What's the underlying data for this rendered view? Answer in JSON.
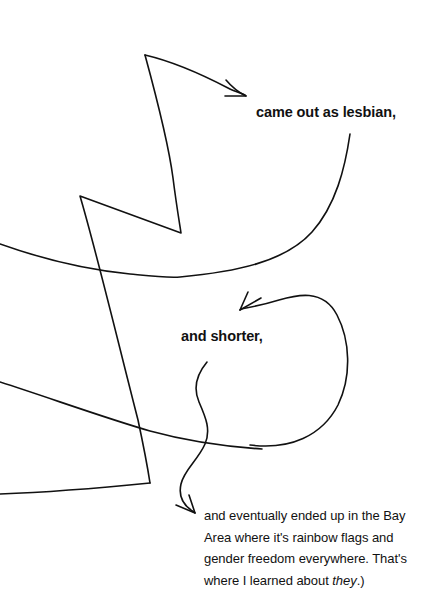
{
  "page": {
    "width": 440,
    "height": 600,
    "background_color": "#ffffff",
    "ink_color": "#111111"
  },
  "annotations": {
    "label_lesbian": "came out as lesbian,",
    "label_shorter": "and shorter,",
    "paragraph_bay_area": {
      "line1": "and eventually ended up in the Bay",
      "line2": "Area where it's rainbow flags and",
      "line3": "gender freedom everywhere. That's",
      "line4_prefix": "where I learned about ",
      "line4_italic": "they",
      "line4_suffix": ".)"
    }
  },
  "sketch": {
    "description": "hand-drawn pen strokes with three arrows",
    "strokes": [
      {
        "name": "arrow-to-lesbian",
        "kind": "arrow",
        "from": [
          145,
          55
        ],
        "to": [
          246,
          96
        ],
        "arrowhead": "right-down"
      },
      {
        "name": "long-descending-zigzag",
        "kind": "open-path",
        "points": [
          [
            145,
            55
          ],
          [
            172,
            170
          ],
          [
            181,
            233
          ],
          [
            80,
            196
          ],
          [
            150,
            483
          ]
        ]
      },
      {
        "name": "long-horizontal-curve",
        "kind": "open-path",
        "points": [
          [
            0,
            244
          ],
          [
            120,
            270
          ],
          [
            178,
            277
          ],
          [
            300,
            250
          ],
          [
            350,
            134
          ]
        ]
      },
      {
        "name": "lower-left-diagonal",
        "kind": "open-path",
        "points": [
          [
            0,
            382
          ],
          [
            150,
            430
          ],
          [
            260,
            448
          ]
        ]
      },
      {
        "name": "lower-left-base",
        "kind": "open-path",
        "points": [
          [
            150,
            483
          ],
          [
            60,
            492
          ],
          [
            0,
            494
          ]
        ]
      },
      {
        "name": "big-loop-arrow",
        "kind": "arrow",
        "from": [
          250,
          444
        ],
        "to": [
          240,
          310
        ],
        "arrowhead": "left-down"
      },
      {
        "name": "wavy-arrow-to-paragraph",
        "kind": "arrow",
        "from": [
          207,
          362
        ],
        "to": [
          195,
          513
        ],
        "arrowhead": "right-down"
      }
    ]
  }
}
